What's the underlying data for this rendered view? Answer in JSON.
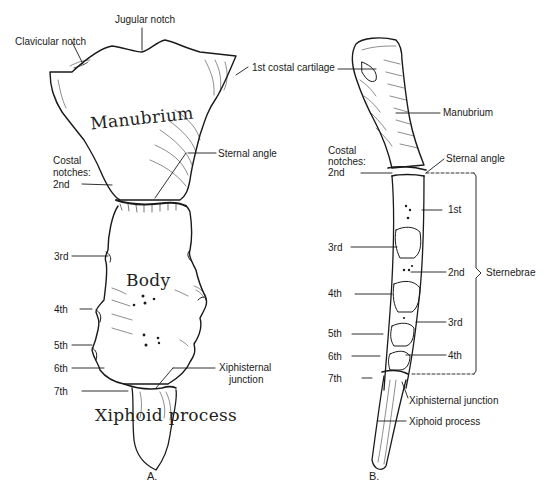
{
  "figure_a": {
    "caption": "A.",
    "region_labels": {
      "manubrium": "Manubrium",
      "body": "Body",
      "xiphoid": "Xiphoid process"
    },
    "labels": {
      "jugular_notch": "Jugular notch",
      "clavicular_notch": "Clavicular notch",
      "first_costal_cartilage": "1st costal cartilage",
      "sternal_angle": "Sternal angle",
      "costal_notches_line1": "Costal",
      "costal_notches_line2": "notches:",
      "costal_2nd": "2nd",
      "costal_3rd": "3rd",
      "costal_4th": "4th",
      "costal_5th": "5th",
      "costal_6th": "6th",
      "costal_7th": "7th",
      "xiphisternal_line1": "Xiphisternal",
      "xiphisternal_line2": "junction"
    }
  },
  "figure_b": {
    "caption": "B.",
    "labels": {
      "manubrium": "Manubrium",
      "sternal_angle": "Sternal angle",
      "costal_notches_line1": "Costal",
      "costal_notches_line2": "notches:",
      "costal_2nd": "2nd",
      "costal_3rd": "3rd",
      "costal_4th": "4th",
      "costal_5th": "5th",
      "costal_6th": "6th",
      "costal_7th": "7th",
      "sternebra_1st": "1st",
      "sternebra_2nd": "2nd",
      "sternebra_3rd": "3rd",
      "sternebra_4th": "4th",
      "sternebrae": "Sternebrae",
      "xiphisternal_junction": "Xiphisternal junction",
      "xiphoid_process": "Xiphoid process"
    }
  }
}
